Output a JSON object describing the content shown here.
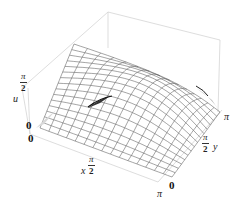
{
  "chart_data": {
    "type": "surface3d",
    "title": "",
    "function_description": "u(x,y) surface over 0<=x<=pi, 0<=y<=pi, rendered as wireframe mesh with saddle-like shape",
    "xlabel": "x",
    "ylabel": "y",
    "zlabel": "u",
    "x_range": [
      "0",
      "π"
    ],
    "y_range": [
      "0",
      "π"
    ],
    "z_range": [
      "0",
      "π/2"
    ],
    "x_ticks": [
      "0",
      "π/2",
      "π"
    ],
    "y_ticks": [
      "0",
      "π/2",
      "π"
    ],
    "z_ticks": [
      "0",
      "π/2"
    ],
    "mesh_lines": 15,
    "bounding_box": true,
    "surface_features": [
      {
        "name": "back-peak",
        "approx_u": "π/2"
      },
      {
        "name": "left-peak",
        "approx_u": "≈π/2"
      },
      {
        "name": "front-left-corner",
        "approx_u": "0"
      },
      {
        "name": "right-corner",
        "approx_u": "0"
      },
      {
        "name": "front-corner",
        "approx_u": "0"
      }
    ],
    "colors": {
      "mesh": "#555555",
      "surface_fill": "#ffffff",
      "shading_dark": "#222222",
      "box": "#c8c8c8"
    }
  },
  "labels": {
    "z_axis_name": "u",
    "z_tick_top_num": "π",
    "z_tick_top_den": "2",
    "z_tick_zero": "0",
    "x_tick_zero": "0",
    "x_axis_name": "x",
    "x_tick_mid_num": "π",
    "x_tick_mid_den": "2",
    "x_tick_end": "π",
    "y_tick_zero": "0",
    "y_tick_mid_num": "π",
    "y_tick_mid_den": "2",
    "y_axis_name": "y",
    "y_tick_end": "π"
  }
}
